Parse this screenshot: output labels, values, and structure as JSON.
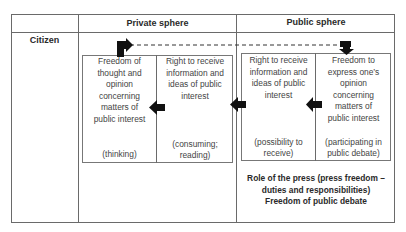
{
  "table": {
    "headers": {
      "row_label": "",
      "private": "Private sphere",
      "public": "Public sphere"
    },
    "row_label": "Citizen"
  },
  "private_sphere": {
    "cells": [
      {
        "title": "Freedom of thought and opinion concerning matters of public interest",
        "lines": [
          "Freedom of",
          "thought and",
          "opinion",
          "concerning",
          "matters of",
          "public interest"
        ],
        "note": "(thinking)"
      },
      {
        "title": "Right to receive information and ideas of public interest",
        "lines": [
          "Right to receive",
          "information and",
          "ideas of public",
          "interest"
        ],
        "note_lines": [
          "(consuming;",
          "reading)"
        ]
      }
    ]
  },
  "public_sphere": {
    "cells": [
      {
        "title": "Right to receive information and ideas of public interest",
        "lines": [
          "Right to receive",
          "information and",
          "ideas of public",
          "interest"
        ],
        "note_lines": [
          "(possibility to",
          "receive)"
        ]
      },
      {
        "title": "Freedom to express one's opinion concerning matters of public interest",
        "lines": [
          "Freedom to",
          "express one’s",
          "opinion",
          "concerning",
          "matters of",
          "public interest"
        ],
        "note_lines": [
          "(participating in",
          "public debate)"
        ]
      }
    ],
    "footer_lines": [
      "Role of the press (press freedom –",
      "duties and responsibilities)",
      "Freedom of public debate"
    ]
  },
  "arrows": [
    {
      "from": "public.freedom_to_express",
      "to": "public.right_to_receive",
      "direction": "left"
    },
    {
      "from": "public.right_to_receive",
      "to": "private.right_to_receive",
      "direction": "left"
    },
    {
      "from": "private.right_to_receive",
      "to": "private.freedom_of_thought",
      "direction": "left"
    },
    {
      "from": "private.freedom_of_thought",
      "to": "public.freedom_to_express",
      "direction": "feedback-loop",
      "style": "dashed"
    }
  ],
  "colors": {
    "lines": "#6a6a6a",
    "arrows": "#111111",
    "text": "#444444"
  }
}
